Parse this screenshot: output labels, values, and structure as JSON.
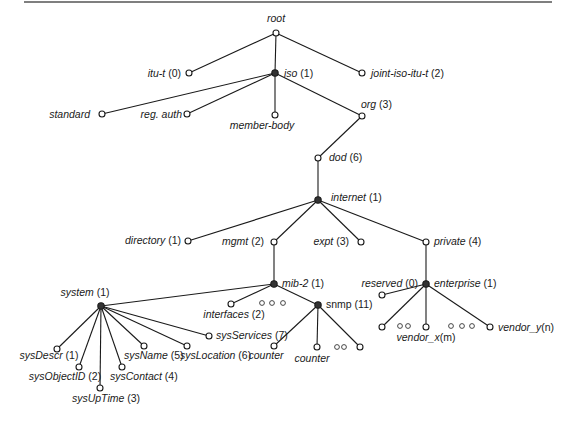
{
  "diagram": {
    "top_rule": {
      "x1": 24,
      "x2": 552,
      "y": 2
    },
    "nodes": [
      {
        "id": "root",
        "x": 276,
        "y": 33,
        "hub": false,
        "name": "root",
        "num": "",
        "lx": 276,
        "ly": 22,
        "anchor": "middle"
      },
      {
        "id": "itu-t",
        "x": 189,
        "y": 73,
        "hub": false,
        "name": "itu-t",
        "num": " (0)",
        "lx": 181,
        "ly": 77,
        "anchor": "end"
      },
      {
        "id": "iso",
        "x": 275,
        "y": 73,
        "hub": true,
        "name": "iso",
        "num": " (1)",
        "lx": 284,
        "ly": 77,
        "anchor": "start"
      },
      {
        "id": "joint-iso-itu-t",
        "x": 362,
        "y": 73,
        "hub": false,
        "name": "joint-iso-itu-t",
        "num": " (2)",
        "lx": 371,
        "ly": 77,
        "anchor": "start"
      },
      {
        "id": "standard",
        "x": 102,
        "y": 114,
        "hub": false,
        "name": "standard",
        "num": "",
        "lx": 90,
        "ly": 118,
        "anchor": "end"
      },
      {
        "id": "reg-auth",
        "x": 187,
        "y": 114,
        "hub": false,
        "name": "reg. auth",
        "num": "",
        "lx": 182,
        "ly": 118,
        "anchor": "end"
      },
      {
        "id": "member-body",
        "x": 275,
        "y": 115,
        "hub": false,
        "name": "member-body",
        "num": "",
        "lx": 262,
        "ly": 129,
        "anchor": "middle"
      },
      {
        "id": "org",
        "x": 362,
        "y": 116,
        "hub": false,
        "name": "org",
        "num": " (3)",
        "lx": 361,
        "ly": 108,
        "anchor": "start"
      },
      {
        "id": "dod",
        "x": 318,
        "y": 158,
        "hub": false,
        "name": "dod",
        "num": " (6)",
        "lx": 329,
        "ly": 161,
        "anchor": "start"
      },
      {
        "id": "internet",
        "x": 318,
        "y": 200,
        "hub": true,
        "name": "internet",
        "num": " (1)",
        "lx": 331,
        "ly": 201,
        "anchor": "start"
      },
      {
        "id": "directory",
        "x": 188,
        "y": 241,
        "hub": false,
        "name": "directory",
        "num": " (1)",
        "lx": 181,
        "ly": 244,
        "anchor": "end"
      },
      {
        "id": "mgmt",
        "x": 274,
        "y": 242,
        "hub": false,
        "name": "mgmt",
        "num": " (2)",
        "lx": 264,
        "ly": 245,
        "anchor": "end"
      },
      {
        "id": "expt",
        "x": 361,
        "y": 242,
        "hub": false,
        "name": "expt",
        "num": " (3)",
        "lx": 349,
        "ly": 245,
        "anchor": "end"
      },
      {
        "id": "private",
        "x": 426,
        "y": 242,
        "hub": false,
        "name": "private",
        "num": " (4)",
        "lx": 434,
        "ly": 245,
        "anchor": "start"
      },
      {
        "id": "mib-2",
        "x": 274,
        "y": 284,
        "hub": true,
        "name": "mib-2",
        "num": " (1)",
        "lx": 282,
        "ly": 287,
        "anchor": "start"
      },
      {
        "id": "enterprise",
        "x": 426,
        "y": 284,
        "hub": true,
        "name": "enterprise",
        "num": " (1)",
        "lx": 434,
        "ly": 287,
        "anchor": "start"
      },
      {
        "id": "reserved",
        "x": 382,
        "y": 295,
        "hub": false,
        "name": "reserved",
        "num": " (0)",
        "lx": 418,
        "ly": 287,
        "anchor": "end"
      },
      {
        "id": "system",
        "x": 101,
        "y": 306,
        "hub": true,
        "name": "system",
        "num": " (1)",
        "lx": 85,
        "ly": 296,
        "anchor": "middle"
      },
      {
        "id": "interfaces",
        "x": 231,
        "y": 304,
        "hub": false,
        "name": "interfaces",
        "num": " (2)",
        "lx": 234,
        "ly": 318,
        "anchor": "middle"
      },
      {
        "id": "snmp",
        "x": 318,
        "y": 305,
        "hub": true,
        "name": "snmp",
        "num": " (11)",
        "lx": 326,
        "ly": 308,
        "anchor": "start",
        "upright": true
      },
      {
        "id": "vendor-a",
        "x": 382,
        "y": 327,
        "hub": false,
        "name": "",
        "num": "",
        "lx": 0,
        "ly": 0,
        "anchor": "start"
      },
      {
        "id": "vendor_x",
        "x": 426,
        "y": 327,
        "hub": false,
        "name": "vendor_x",
        "num": "(m)",
        "lx": 426,
        "ly": 341,
        "anchor": "middle"
      },
      {
        "id": "vendor_y",
        "x": 490,
        "y": 327,
        "hub": false,
        "name": "vendor_y",
        "num": "(n)",
        "lx": 498,
        "ly": 331,
        "anchor": "start"
      },
      {
        "id": "sysServices",
        "x": 209,
        "y": 336,
        "hub": false,
        "name": "sysServices",
        "num": " (7)",
        "lx": 216,
        "ly": 339,
        "anchor": "start"
      },
      {
        "id": "sysLocation",
        "x": 187,
        "y": 346,
        "hub": false,
        "name": "sysLocation",
        "num": " (6)",
        "lx": 180,
        "ly": 359,
        "anchor": "start"
      },
      {
        "id": "sysName",
        "x": 144,
        "y": 346,
        "hub": false,
        "name": "sysName",
        "num": " (5)",
        "lx": 124,
        "ly": 359,
        "anchor": "start"
      },
      {
        "id": "sysDescr",
        "x": 57,
        "y": 349,
        "hub": false,
        "name": "sysDescr",
        "num": " (1)",
        "lx": 49,
        "ly": 359,
        "anchor": "middle"
      },
      {
        "id": "counter-1",
        "x": 274,
        "y": 346,
        "hub": false,
        "name": "counter",
        "num": "",
        "lx": 266,
        "ly": 359,
        "anchor": "middle"
      },
      {
        "id": "counter-2",
        "x": 317,
        "y": 347,
        "hub": false,
        "name": "counter",
        "num": "",
        "lx": 312,
        "ly": 362,
        "anchor": "middle"
      },
      {
        "id": "snmp-c3",
        "x": 360,
        "y": 347,
        "hub": false,
        "name": "",
        "num": "",
        "lx": 0,
        "ly": 0,
        "anchor": "start"
      },
      {
        "id": "sysObjectID",
        "x": 79,
        "y": 367,
        "hub": false,
        "name": "sysObjectID",
        "num": " (2)",
        "lx": 65,
        "ly": 380,
        "anchor": "middle"
      },
      {
        "id": "sysContact",
        "x": 122,
        "y": 367,
        "hub": false,
        "name": "sysContact",
        "num": " (4)",
        "lx": 110,
        "ly": 380,
        "anchor": "start"
      },
      {
        "id": "sysUpTime",
        "x": 100,
        "y": 388,
        "hub": false,
        "name": "sysUpTime",
        "num": " (3)",
        "lx": 106,
        "ly": 402,
        "anchor": "middle"
      }
    ],
    "edges": [
      [
        "root",
        "itu-t"
      ],
      [
        "root",
        "iso"
      ],
      [
        "root",
        "joint-iso-itu-t"
      ],
      [
        "iso",
        "standard"
      ],
      [
        "iso",
        "reg-auth"
      ],
      [
        "iso",
        "member-body"
      ],
      [
        "iso",
        "org"
      ],
      [
        "org",
        "dod"
      ],
      [
        "dod",
        "internet"
      ],
      [
        "internet",
        "directory"
      ],
      [
        "internet",
        "mgmt"
      ],
      [
        "internet",
        "expt"
      ],
      [
        "internet",
        "private"
      ],
      [
        "mgmt",
        "mib-2"
      ],
      [
        "private",
        "enterprise"
      ],
      [
        "mib-2",
        "system"
      ],
      [
        "mib-2",
        "interfaces"
      ],
      [
        "mib-2",
        "snmp"
      ],
      [
        "enterprise",
        "reserved"
      ],
      [
        "enterprise",
        "vendor-a"
      ],
      [
        "enterprise",
        "vendor_x"
      ],
      [
        "enterprise",
        "vendor_y"
      ],
      [
        "snmp",
        "counter-1"
      ],
      [
        "snmp",
        "counter-2"
      ],
      [
        "snmp",
        "snmp-c3"
      ],
      [
        "system",
        "sysDescr"
      ],
      [
        "system",
        "sysObjectID"
      ],
      [
        "system",
        "sysUpTime"
      ],
      [
        "system",
        "sysContact"
      ],
      [
        "system",
        "sysName"
      ],
      [
        "system",
        "sysLocation"
      ],
      [
        "system",
        "sysServices"
      ]
    ],
    "ellipses": [
      {
        "after": "interfaces",
        "dots": [
          [
            262,
            303
          ],
          [
            272,
            303
          ],
          [
            283,
            303
          ]
        ]
      },
      {
        "after": "counter-2",
        "dots": [
          [
            337,
            347
          ],
          [
            344,
            347
          ]
        ]
      },
      {
        "after": "vendor-a",
        "dots": [
          [
            400,
            326
          ],
          [
            408,
            326
          ]
        ]
      },
      {
        "after": "vendor_x",
        "dots": [
          [
            451,
            326
          ],
          [
            462,
            326
          ],
          [
            472,
            326
          ]
        ]
      }
    ]
  }
}
